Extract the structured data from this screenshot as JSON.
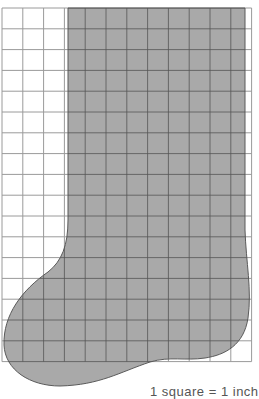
{
  "figure": {
    "caption": "1 square = 1 inch",
    "grid": {
      "x0": 2,
      "y0": 8,
      "cols": 12,
      "rows": 17,
      "cell": 20.8,
      "line_color": "#9a9a9a",
      "line_color_inside": "#555555"
    },
    "shape": {
      "fill": "#a9a9a9",
      "stroke": "#5a5a5a",
      "label": "stocking-shape"
    },
    "colors": {
      "background": "#ffffff"
    }
  }
}
